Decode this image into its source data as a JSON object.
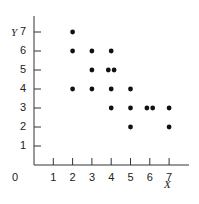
{
  "chart_data": {
    "type": "scatter",
    "title": "",
    "xlabel": "X",
    "ylabel": "Y",
    "xlim": [
      0,
      8
    ],
    "ylim": [
      0,
      7.5
    ],
    "x_ticks": [
      "1",
      "2",
      "3",
      "4",
      "5",
      "6",
      "7"
    ],
    "y_ticks": [
      "1",
      "2",
      "3",
      "4",
      "5",
      "6",
      "7"
    ],
    "origin_label": "0",
    "grid": false,
    "legend": null,
    "points": [
      {
        "x": 2,
        "y": 7
      },
      {
        "x": 2,
        "y": 6
      },
      {
        "x": 2,
        "y": 4
      },
      {
        "x": 3,
        "y": 6
      },
      {
        "x": 3,
        "y": 5
      },
      {
        "x": 3,
        "y": 4
      },
      {
        "x": 4,
        "y": 6
      },
      {
        "x": 3.85,
        "y": 5
      },
      {
        "x": 4.15,
        "y": 5
      },
      {
        "x": 4,
        "y": 4
      },
      {
        "x": 4,
        "y": 3
      },
      {
        "x": 5,
        "y": 4
      },
      {
        "x": 5,
        "y": 3
      },
      {
        "x": 5,
        "y": 2
      },
      {
        "x": 5.85,
        "y": 3
      },
      {
        "x": 6.15,
        "y": 3
      },
      {
        "x": 7,
        "y": 3
      },
      {
        "x": 7,
        "y": 2
      }
    ]
  },
  "labels": {
    "x_axis_title": "X",
    "y_axis_title": "Y",
    "origin": "0"
  }
}
